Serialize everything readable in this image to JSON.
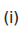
{
  "label": {
    "text": "(i)"
  }
}
